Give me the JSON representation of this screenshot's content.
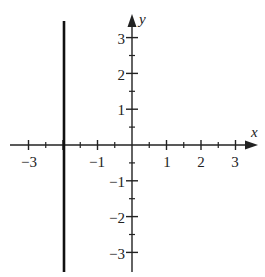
{
  "chart_data": {
    "type": "line",
    "title": "",
    "xlabel": "x",
    "ylabel": "y",
    "xlim": [
      -3.5,
      3.5
    ],
    "ylim": [
      -3.5,
      3.5
    ],
    "grid": false,
    "x_tick_labels": [
      "−3",
      "−1",
      "1",
      "2",
      "3"
    ],
    "x_tick_values": [
      -3,
      -1,
      1,
      2,
      3
    ],
    "y_tick_labels": [
      "3",
      "2",
      "1",
      "−1",
      "−2",
      "−3"
    ],
    "y_tick_values": [
      3,
      2,
      1,
      -1,
      -2,
      -3
    ],
    "minor_tick_step": 0.5,
    "series": [
      {
        "name": "x = -2",
        "kind": "vertical-line",
        "x": -2,
        "y_range": [
          -3.5,
          3.4
        ]
      }
    ]
  },
  "labels": {
    "x_axis": "x",
    "y_axis": "y",
    "x_ticks": [
      "−3",
      "−1",
      "1",
      "2",
      "3"
    ],
    "y_ticks": [
      "3",
      "2",
      "1",
      "−1",
      "−2",
      "−3"
    ]
  }
}
